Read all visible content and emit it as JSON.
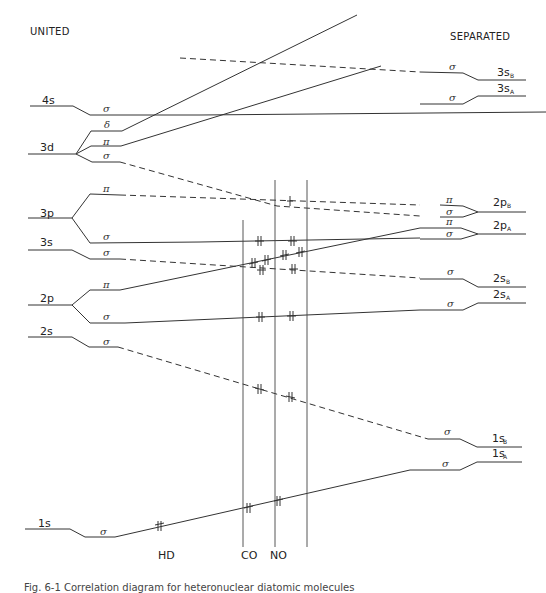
{
  "diagram": {
    "type": "molecular-orbital-correlation-diagram",
    "left_header": "UNITED",
    "right_header": "SEPARATED",
    "united_atom_levels": [
      {
        "label": "4s",
        "orbitals": [
          "σ"
        ]
      },
      {
        "label": "3d",
        "orbitals": [
          "δ",
          "π",
          "σ"
        ]
      },
      {
        "label": "3p",
        "orbitals": [
          "π",
          "σ"
        ]
      },
      {
        "label": "3s",
        "orbitals": [
          "σ"
        ]
      },
      {
        "label": "2p",
        "orbitals": [
          "π",
          "σ"
        ]
      },
      {
        "label": "2s",
        "orbitals": [
          "σ"
        ]
      },
      {
        "label": "1s",
        "orbitals": [
          "σ"
        ]
      }
    ],
    "separated_atom_levels": [
      {
        "label": "3s",
        "sub": "B",
        "orbitals": [
          "σ"
        ]
      },
      {
        "label": "3s",
        "sub": "A",
        "orbitals": [
          "σ"
        ]
      },
      {
        "label": "2p",
        "sub": "B",
        "orbitals": [
          "π",
          "σ"
        ]
      },
      {
        "label": "2p",
        "sub": "A",
        "orbitals": [
          "π",
          "σ"
        ]
      },
      {
        "label": "2s",
        "sub": "B",
        "orbitals": [
          "σ"
        ]
      },
      {
        "label": "2s",
        "sub": "A",
        "orbitals": [
          "σ"
        ]
      },
      {
        "label": "1s",
        "sub": "B",
        "orbitals": [
          "σ"
        ]
      },
      {
        "label": "1s",
        "sub": "A",
        "orbitals": [
          "σ"
        ]
      }
    ],
    "molecule_markers": [
      {
        "label": "HD"
      },
      {
        "label": "CO"
      },
      {
        "label": "NO"
      }
    ],
    "caption": "Fig. 6-1  Correlation diagram for heteronuclear diatomic molecules"
  },
  "labels": {
    "united": "UNITED",
    "separated": "SEPARATED",
    "u4s": "4s",
    "u3d": "3d",
    "u3p": "3p",
    "u3s": "3s",
    "u2p": "2p",
    "u2s": "2s",
    "u1s": "1s",
    "sigma": "σ",
    "pi": "π",
    "delta": "δ",
    "s3": "3s",
    "p2": "2p",
    "s2": "2s",
    "s1": "1s",
    "subA": "A",
    "subB": "B",
    "hd": "HD",
    "co": "CO",
    "no": "NO"
  }
}
